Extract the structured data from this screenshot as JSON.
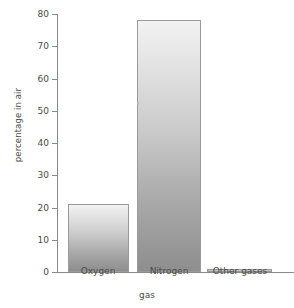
{
  "chart_data": {
    "type": "bar",
    "title": "",
    "xlabel": "gas",
    "ylabel": "percentage in air",
    "categories": [
      "Oxygen",
      "Nitrogen",
      "Other gases"
    ],
    "values": [
      21,
      78,
      1
    ],
    "ylim": [
      0,
      80
    ],
    "ytick_labels": [
      "0",
      "10",
      "20",
      "30",
      "40",
      "50",
      "60",
      "70",
      "80"
    ],
    "ytick_values": [
      0,
      10,
      20,
      30,
      40,
      50,
      60,
      70,
      80
    ],
    "grid": false,
    "legend": false,
    "legend_position": "none",
    "bar_fill_top_color": "#f2f2f2",
    "bar_fill_bottom_color": "#8e8e8e",
    "bar_outline_color": "#9a9a9a",
    "axis_color": "#8a8a8a",
    "text_color": "#4a4a4a",
    "background_color": "#ffffff"
  }
}
